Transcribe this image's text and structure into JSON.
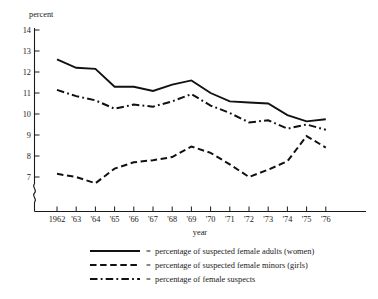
{
  "chart_data": {
    "type": "line",
    "title": "",
    "xlabel": "year",
    "ylabel": "percent",
    "ylim": [
      5.6,
      14
    ],
    "yticks": [
      6,
      7,
      8,
      9,
      10,
      11,
      12,
      13,
      14
    ],
    "ytick_labels": [
      "6",
      "7",
      "8",
      "9",
      "10",
      "11",
      "12",
      "13",
      "14"
    ],
    "axis_break": true,
    "grid": false,
    "legend_position": "below",
    "categories": [
      "1962",
      "'63",
      "'64",
      "'65",
      "'66",
      "'67",
      "'68",
      "'69",
      "'70",
      "'71",
      "'72",
      "'73",
      "'74",
      "'75",
      "'76"
    ],
    "x": [
      1962,
      1963,
      1964,
      1965,
      1966,
      1967,
      1968,
      1969,
      1970,
      1971,
      1972,
      1973,
      1974,
      1975,
      1976
    ],
    "series": [
      {
        "name": "percentage of suspected female adults (women)",
        "style": "solid",
        "values": [
          12.6,
          12.2,
          12.15,
          11.3,
          11.3,
          11.1,
          11.4,
          11.6,
          11.0,
          10.6,
          10.55,
          10.5,
          9.95,
          9.65,
          9.75
        ]
      },
      {
        "name": "percentage of suspected female minors (girls)",
        "style": "dashed",
        "values": [
          7.15,
          7.0,
          6.7,
          7.4,
          7.7,
          7.8,
          7.95,
          8.45,
          8.15,
          7.6,
          7.0,
          7.35,
          7.75,
          8.95,
          8.4
        ]
      },
      {
        "name": "percentage of female suspects",
        "style": "dash-dot",
        "values": [
          11.15,
          10.85,
          10.65,
          10.25,
          10.45,
          10.35,
          10.6,
          10.95,
          10.4,
          10.05,
          9.6,
          9.7,
          9.3,
          9.5,
          9.25
        ]
      }
    ]
  },
  "axes": {
    "y_title": "percent",
    "x_title": "year"
  },
  "legend": {
    "equals": "=",
    "items": [
      {
        "marker": "solid-line",
        "label": "percentage of suspected female adults (women)"
      },
      {
        "marker": "dashed-line",
        "label": "percentage of suspected female minors (girls)"
      },
      {
        "marker": "dash-dot-line",
        "label": "percentage of female suspects"
      }
    ]
  }
}
